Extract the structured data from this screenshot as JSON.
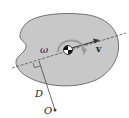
{
  "figure": {
    "labels": {
      "omega": "ω",
      "velocity": "v",
      "distance": "D",
      "point": "O"
    },
    "colors": {
      "body_fill": "#c8c8c8",
      "body_stroke": "#555555",
      "line": "#333333",
      "arc": "#9a9a9a",
      "background": "#ffffff"
    }
  }
}
